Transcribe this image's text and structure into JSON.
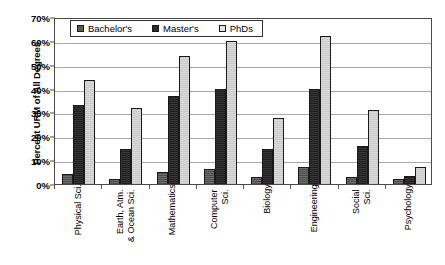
{
  "chart_data": {
    "type": "bar",
    "title": "",
    "xlabel": "",
    "ylabel": "Percent URM of All Degrees",
    "ylim": [
      0,
      70
    ],
    "ytick_labels": [
      "0%",
      "10%",
      "20%",
      "30%",
      "40%",
      "50%",
      "60%",
      "70%"
    ],
    "ytick_values": [
      0,
      10,
      20,
      30,
      40,
      50,
      60,
      70
    ],
    "grid": true,
    "legend_position": "top-left-inside",
    "categories": [
      "Physical Sci.",
      "Earth, Atm.\n& Ocean Sci.",
      "Mathematics",
      "Computer\nSci.",
      "Biology",
      "Engineering",
      "Social\nSci.",
      "Psychology"
    ],
    "series": [
      {
        "name": "Bachelor's",
        "color": "#5a5a5a",
        "values": [
          4.2,
          2.0,
          5.0,
          6.5,
          2.8,
          7.0,
          3.0,
          2.0
        ]
      },
      {
        "name": "Master's",
        "color": "#2b2b2b",
        "values": [
          33.0,
          14.5,
          37.0,
          40.0,
          14.7,
          40.0,
          16.0,
          3.4
        ]
      },
      {
        "name": "PhDs",
        "color": "#d2d2d2",
        "values": [
          43.5,
          31.8,
          53.5,
          59.8,
          27.5,
          62.0,
          31.0,
          7.0
        ]
      }
    ]
  }
}
